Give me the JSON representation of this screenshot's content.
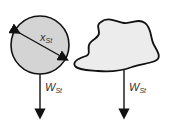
{
  "diagram": {
    "sphere": {
      "diameter_label": "x",
      "diameter_sub": "St",
      "weight_label": "W",
      "weight_sub": "St",
      "fill": "#d4d4d4"
    },
    "irregular": {
      "weight_label": "W",
      "weight_sub": "St",
      "fill": "#ececec"
    },
    "stroke": "#111111"
  }
}
